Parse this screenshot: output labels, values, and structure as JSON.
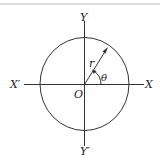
{
  "figure": {
    "labels": {
      "y_pos": "Y",
      "y_neg": "Y′",
      "x_pos": "X",
      "x_neg": "X′",
      "origin": "O",
      "radius": "r",
      "angle": "θ"
    },
    "colors": {
      "stroke": "#333333",
      "top_rule": "#bbbbbb",
      "background": "#ffffff"
    }
  }
}
